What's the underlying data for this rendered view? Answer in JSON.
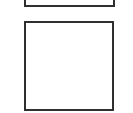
{
  "diagram": {
    "shapes": [
      {
        "id": "top-box",
        "type": "rectangle",
        "partially_visible": true,
        "stroke": "#2f2f2f",
        "fill": "#ffffff"
      },
      {
        "id": "bottom-box",
        "type": "square",
        "partially_visible": false,
        "stroke": "#2f2f2f",
        "fill": "#ffffff"
      }
    ],
    "background": "#ffffff"
  }
}
